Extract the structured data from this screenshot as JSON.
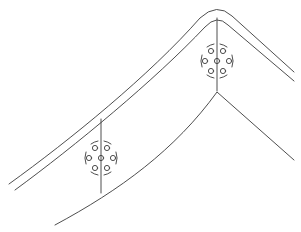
{
  "diagram": {
    "title": "",
    "stroke_color": "#3a3a3a",
    "background": "#ffffff",
    "elements": {
      "outer_rafter": {
        "label": ""
      },
      "inner_rafter": {
        "label": ""
      },
      "bottom_chord": {
        "label": ""
      },
      "ridge_post": {
        "label": ""
      },
      "side_post": {
        "label": ""
      },
      "bolt_group_ridge": {
        "bolt_count": 6,
        "center_bolt": true,
        "label": ""
      },
      "bolt_group_side": {
        "bolt_count": 6,
        "center_bolt": true,
        "label": ""
      }
    }
  }
}
